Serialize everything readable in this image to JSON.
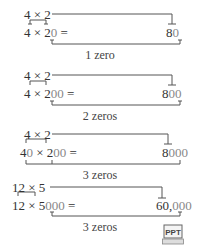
{
  "examples": [
    {
      "fact": "4 × 2",
      "lhs_prefix": "4 × 2",
      "lhs_zeros": "0",
      "equals": "=",
      "result_prefix": "8",
      "result_zeros": "0",
      "label": "1 zero"
    },
    {
      "fact": "4 × 2",
      "lhs_prefix": "4 × 2",
      "lhs_zeros": "00",
      "equals": "=",
      "result_prefix": "8",
      "result_zeros": "00",
      "label": "2 zeros"
    },
    {
      "fact": "4 × 2",
      "lhs_a": "4",
      "lhs_a_zeros": "0",
      "lhs_mid": " × 2",
      "lhs_zeros": "00",
      "equals": "=",
      "result_prefix": "8",
      "result_zeros": "000",
      "label": "3 zeros"
    },
    {
      "fact": "12 × 5",
      "lhs_prefix": "12 × 5",
      "lhs_zeros": "000",
      "equals": "=",
      "result_prefix": "60,",
      "result_zeros": "000",
      "label": "3 zeros"
    }
  ],
  "icon": {
    "label": "PPT"
  }
}
